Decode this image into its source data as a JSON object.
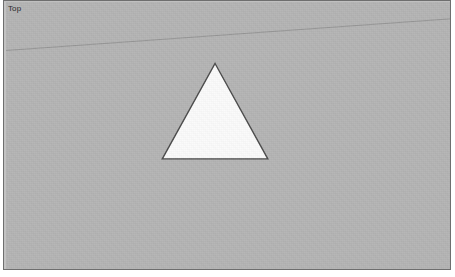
{
  "window": {
    "view_label": "Top",
    "background_color": "#b4b4b4",
    "frame_border_color": "#6e6e6e",
    "page_background": "#ffffff"
  },
  "viewport": {
    "width": 448,
    "height": 270,
    "label_position": "top-left"
  },
  "geometry": {
    "horizon_line": {
      "name": "ground-horizon-line",
      "color": "#8e8e8e",
      "stroke_width": 0.8,
      "x1": 0,
      "y1": 50,
      "x2": 448,
      "y2": 18
    },
    "triangle": {
      "name": "triangle-face",
      "fill_color": "#fbfbfb",
      "edge_color": "#4a4a4a",
      "edge_width": 1.4,
      "apex": {
        "x": 212,
        "y": 63
      },
      "bottom_left": {
        "x": 159,
        "y": 159
      },
      "bottom_right": {
        "x": 265,
        "y": 159
      },
      "points": "212,63 265,159 159,159"
    }
  }
}
